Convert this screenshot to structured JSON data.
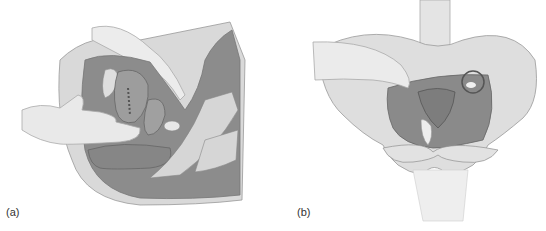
{
  "figure": {
    "panels": [
      {
        "id": "a",
        "label": "(a)",
        "view": "sagittal-section"
      },
      {
        "id": "b",
        "label": "(b)",
        "view": "anterior-pelvis"
      }
    ],
    "colors": {
      "background": "#ffffff",
      "skin_light": "#e6e6e6",
      "tissue_mid": "#9a9a9a",
      "tissue_dark": "#7e7e7e",
      "bone": "#dcdcdc",
      "outline": "#8a8a8a"
    }
  }
}
